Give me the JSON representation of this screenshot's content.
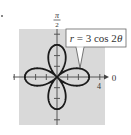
{
  "figure": {
    "equation_label": "r = 3 cos 2θ",
    "equation_parts": {
      "lhs": "r",
      "eq": " = 3 cos 2",
      "theta": "θ"
    },
    "polar_axis_label": "0",
    "vertical_axis_label_num": "π",
    "vertical_axis_label_den": "2",
    "tick_label": "4",
    "colors": {
      "background": "#d9d9d9",
      "curve": "#1a1a1a",
      "axis": "#555555",
      "label_box": "#ffffff"
    }
  },
  "chart_data": {
    "type": "line",
    "title": "r = 3 cos 2θ",
    "coordinate_system": "polar",
    "function": "r = 3*cos(2*theta)",
    "theta_range": [
      0,
      6.283185
    ],
    "petals": 4,
    "max_r": 3,
    "axis_labels": {
      "polar_axis": "0",
      "vertical": "π/2"
    },
    "tick_labels": [
      "4"
    ],
    "axis_range": [
      -4,
      4
    ],
    "tick_step": 1
  }
}
